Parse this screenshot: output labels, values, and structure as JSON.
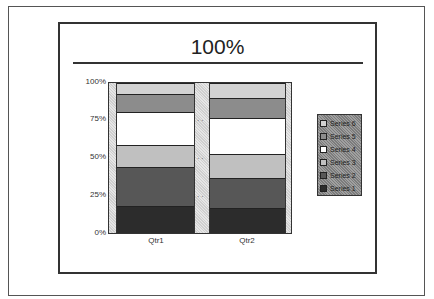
{
  "title": "100%",
  "yaxis": {
    "ticks": [
      "100%",
      "75%",
      "50%",
      "25%",
      "0%"
    ]
  },
  "xaxis": {
    "categories": [
      "Qtr1",
      "Qtr2"
    ]
  },
  "legend": {
    "items": [
      {
        "label": "Series 6",
        "color": "#d2d2d2"
      },
      {
        "label": "Series 5",
        "color": "#8c8c8c"
      },
      {
        "label": "Series 4",
        "color": "#ffffff"
      },
      {
        "label": "Series 3",
        "color": "#c0c0c0"
      },
      {
        "label": "Series 2",
        "color": "#575757"
      },
      {
        "label": "Series 1",
        "color": "#2c2c2c"
      }
    ]
  },
  "chart_data": {
    "type": "bar",
    "stacking": "percent",
    "title": "100%",
    "xlabel": "",
    "ylabel": "",
    "categories": [
      "Qtr1",
      "Qtr2"
    ],
    "ylim": [
      0,
      100
    ],
    "yticks": [
      "0%",
      "25%",
      "50%",
      "75%",
      "100%"
    ],
    "grid": false,
    "legend_position": "right",
    "series": [
      {
        "name": "Series 1",
        "values": [
          18,
          17
        ],
        "color": "#2c2c2c"
      },
      {
        "name": "Series 2",
        "values": [
          26,
          20
        ],
        "color": "#575757"
      },
      {
        "name": "Series 3",
        "values": [
          15,
          16
        ],
        "color": "#c0c0c0"
      },
      {
        "name": "Series 4",
        "values": [
          22,
          24
        ],
        "color": "#ffffff"
      },
      {
        "name": "Series 5",
        "values": [
          12,
          13
        ],
        "color": "#8c8c8c"
      },
      {
        "name": "Series 6",
        "values": [
          7,
          10
        ],
        "color": "#d2d2d2"
      }
    ]
  }
}
